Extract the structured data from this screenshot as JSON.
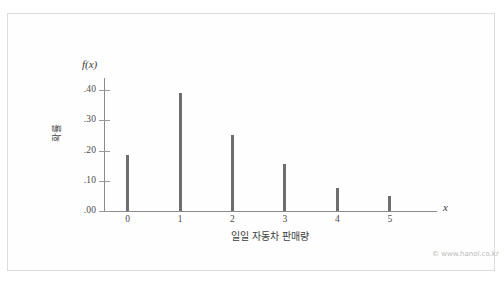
{
  "figure": {
    "watermark": "© www.hanol.co.kr",
    "fx_label": "f(x)",
    "x_var_label": "x"
  },
  "chart_data": {
    "type": "bar",
    "title": "",
    "xlabel": "일일 자동차 판매량",
    "ylabel": "확률",
    "categories": [
      "0",
      "1",
      "2",
      "3",
      "4",
      "5"
    ],
    "values": [
      0.185,
      0.39,
      0.25,
      0.155,
      0.075,
      0.05
    ],
    "ylim": [
      0.0,
      0.44
    ],
    "xlim": [
      -0.45,
      5.9
    ],
    "ytick_labels": [
      ".00",
      ".10",
      ".20",
      ".30",
      ".40"
    ],
    "ytick_values": [
      0.0,
      0.1,
      0.2,
      0.3,
      0.4
    ],
    "xtick_labels": [
      "0",
      "1",
      "2",
      "3",
      "4",
      "5"
    ],
    "grid": false,
    "legend": null,
    "bar_color": "#6e6e6e",
    "axis_color": "#8a8a8a"
  }
}
